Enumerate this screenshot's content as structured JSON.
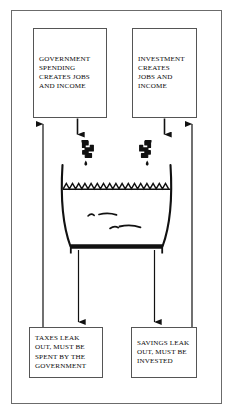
{
  "diagram": {
    "type": "economics-flow-diagram",
    "colors": {
      "ink": "#0a0a0a",
      "frame_border": "#6b6b6b",
      "box_border": "#555555",
      "background": "#ffffff",
      "tub_stroke": "#111111",
      "arrow_stroke": "#111111"
    },
    "boxes": {
      "government_spending": {
        "label": "GOVERNMENT\nSPENDING\nCREATES JOBS\nAND INCOME",
        "position": "top-left"
      },
      "investment": {
        "label": "INVESTMENT\nCREATES\nJOBS  AND\nINCOME",
        "position": "top-right"
      },
      "taxes": {
        "label": "TAXES LEAK\nOUT, MUST BE\nSPENT BY THE\nGOVERNMENT",
        "position": "bottom-left"
      },
      "savings": {
        "label": "SAVINGS LEAK\nOUT, MUST BE\nINVESTED",
        "position": "bottom-right"
      }
    },
    "graphics": {
      "tub": "bathtub-vessel",
      "water_surface": "zigzag-wave-line",
      "left_faucet": "faucet-icon",
      "right_faucet": "faucet-icon",
      "left_drip": "water-drop",
      "right_drip": "water-drop",
      "drain_bar": "tub-drain-base",
      "ripples": "water-ripple-marks"
    },
    "flows": {
      "gov_inflow": "arrow-down-into-tub",
      "inv_inflow": "arrow-down-into-tub",
      "tax_outflow": "arrow-down-to-taxes",
      "sav_outflow": "arrow-down-to-savings",
      "tax_return": "arrow-up-to-government-spending",
      "sav_return": "arrow-up-to-investment"
    }
  }
}
